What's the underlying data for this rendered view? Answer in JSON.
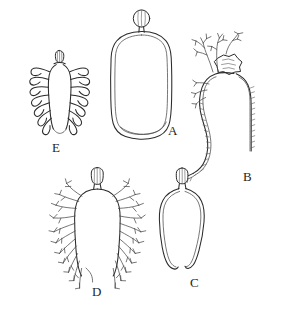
{
  "figure": {
    "type": "scientific-line-drawing-plate",
    "background_color": "#ffffff",
    "ink_color": "#2b2b2b",
    "width_px": 281,
    "height_px": 318,
    "panel_count": 5
  },
  "panels": [
    {
      "id": "A",
      "label": "A",
      "label_x": 168,
      "label_y": 131,
      "description": "Elongated smooth oval capsule with rounded shoulders and a small round bulbous head on a short stalk at the top",
      "outline_style": "double-contour smooth oval",
      "appendages": "none",
      "head": "spherical striated bulb on short stalk"
    },
    {
      "id": "B",
      "label": "B",
      "label_x": 243,
      "label_y": 177,
      "description": "Large curved elongated body with serrated right margin and a cluster of dichotomously branched filaments on the upper left, topped by an irregular star-shaped structure",
      "outline_style": "curved sinuous body with finely serrate margin",
      "appendages": "dichotomously branching filaments",
      "head": "irregular star/flower-shaped aperture"
    },
    {
      "id": "C",
      "label": "C",
      "label_x": 190,
      "label_y": 283,
      "description": "Open narrow loop, U-shaped with free ends at the base, bearing a small striated oval capsule at the top",
      "outline_style": "open slender loop",
      "appendages": "none",
      "head": "oval striated capsule on short neck"
    },
    {
      "id": "D",
      "label": "D",
      "label_x": 92,
      "label_y": 292,
      "description": "Broad flask-shaped central body flanked on both sides by numerous slender, repeatedly forked branching filaments; small striated capsule on top",
      "outline_style": "flask-shaped body",
      "appendages": "numerous forked branching filaments on both margins",
      "head": "small striated oval capsule"
    },
    {
      "id": "E",
      "label": "E",
      "label_x": 52,
      "label_y": 148,
      "description": "Slender central body with about eight pairs of thick hook- or J-shaped lateral lobes arranged symmetrically; small conical cap at the apex",
      "outline_style": "slender axis with paired recurved lobes",
      "appendages": "paired hook-shaped lateral lobes",
      "head": "small conical striated cap"
    }
  ]
}
